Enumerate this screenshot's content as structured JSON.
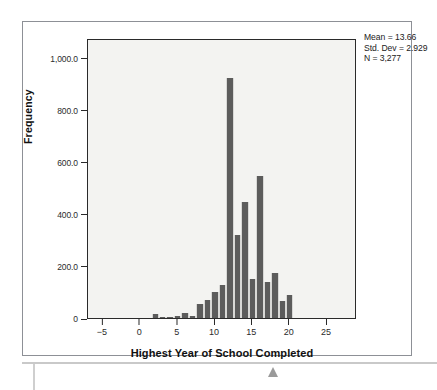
{
  "chart_data": {
    "type": "bar",
    "title": "",
    "subtitle": "",
    "xlabel": "Highest Year of School Completed",
    "ylabel": "Frequency",
    "xlim": [
      -7,
      29
    ],
    "ylim": [
      0,
      1075
    ],
    "grid": false,
    "legend": null,
    "bar_color": "#5c5c5c",
    "plot_background": "#f3f3f1",
    "x_ticks": [
      -5,
      0,
      5,
      10,
      15,
      20,
      25
    ],
    "x_tick_labels": [
      "−5",
      "0",
      "5",
      "10",
      "15",
      "20",
      "25"
    ],
    "y_ticks": [
      0,
      200,
      400,
      600,
      800,
      1000
    ],
    "y_tick_labels": [
      "0",
      "200.0",
      "400.0",
      "600.0",
      "800.0",
      "1,000.0"
    ],
    "bin_width": 1,
    "categories": [
      2,
      3,
      4,
      5,
      6,
      7,
      8,
      9,
      10,
      11,
      12,
      13,
      14,
      15,
      16,
      17,
      18,
      19,
      20
    ],
    "values": [
      14,
      2,
      2,
      8,
      18,
      8,
      55,
      68,
      100,
      128,
      920,
      320,
      445,
      148,
      545,
      140,
      172,
      65,
      88
    ],
    "annotations": [
      "Mean = 13.66",
      "Std. Dev = 2.929",
      "N = 3,277"
    ]
  },
  "figure": {
    "stats": {
      "mean_label": "Mean = 13.66",
      "std_dev_label": "Std. Dev = 2.929",
      "n_label": "N = 3,277"
    },
    "axes": {
      "y_title": "Frequency",
      "x_title": "Highest Year of School Completed"
    }
  }
}
